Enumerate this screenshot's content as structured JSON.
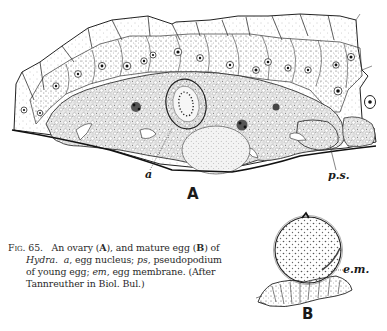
{
  "figure": {
    "number": "Fig. 65.",
    "panel_labels": {
      "A": "A",
      "B": "B"
    },
    "annotations": {
      "a": "a",
      "ps": "p.s.",
      "em": "e.m."
    },
    "caption": {
      "figno": "Fig. 65.",
      "line1_text1": "An ovary (",
      "line1_bold1": "A",
      "line1_text2": "), and mature egg (",
      "line1_bold2": "B",
      "line1_text3": ") of",
      "line2_italic1": "Hydra.",
      "line2_italic2": "a",
      "line2_text1": ", egg nucleus; ",
      "line2_italic3": "ps",
      "line2_text2": ", pseudopodium",
      "line3_text1": "of young egg; ",
      "line3_italic1": "em",
      "line3_text2": ", egg membrane.  (After",
      "line4_text1": "Tannreuther in Biol. Bul.)"
    }
  }
}
